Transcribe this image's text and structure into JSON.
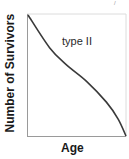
{
  "chart_data": {
    "type": "line",
    "title": "",
    "xlabel": "Age",
    "ylabel": "Number of Survivors",
    "annotations": [
      "type II"
    ],
    "grid": false,
    "legend": null,
    "xlim": [
      0,
      1
    ],
    "ylim": [
      0,
      1
    ],
    "series": [
      {
        "name": "type II",
        "x": [
          0.0,
          0.22,
          0.39,
          0.6,
          0.8,
          0.92,
          1.0
        ],
        "values": [
          1.0,
          0.73,
          0.59,
          0.45,
          0.28,
          0.14,
          0.0
        ]
      }
    ],
    "colors": {
      "line": "#3a3a3a",
      "axis": "#9a9a9a",
      "frame": "#d8d8d8"
    }
  },
  "labels": {
    "y_axis": "Number of Survivors",
    "x_axis": "Age",
    "curve": "type II",
    "corner_mark": "/"
  }
}
